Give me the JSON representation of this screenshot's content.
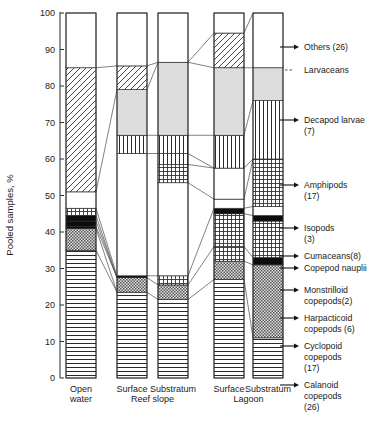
{
  "axis": {
    "y_title": "Pooled samples,  %",
    "y_ticks": [
      "100",
      "90",
      "80",
      "70",
      "60",
      "50",
      "40",
      "30",
      "20",
      "10",
      "0"
    ],
    "y_min": 0,
    "y_max": 100
  },
  "categories": [
    {
      "label_top": "Open",
      "label_bottom": "water",
      "group": ""
    },
    {
      "label_top": "Surface",
      "label_bottom": "",
      "group": "Reef slope"
    },
    {
      "label_top": "Substratum",
      "label_bottom": "",
      "group": "Reef slope"
    },
    {
      "label_top": "Surface",
      "label_bottom": "",
      "group": "Lagoon"
    },
    {
      "label_top": "Substratum",
      "label_bottom": "",
      "group": "Lagoon"
    }
  ],
  "group_labels": [
    {
      "text": "Reef slope"
    },
    {
      "text": "Lagoon"
    }
  ],
  "legend": [
    {
      "key": "others",
      "lines": [
        "Others (26)"
      ],
      "marker": "arrow"
    },
    {
      "key": "larvaceans",
      "lines": [
        "Larvaceans"
      ],
      "marker": "dashed"
    },
    {
      "key": "decapod",
      "lines": [
        "Decapod larvae",
        "(7)"
      ],
      "marker": "arrow"
    },
    {
      "key": "amphipods",
      "lines": [
        "Amphipods",
        "(17)"
      ],
      "marker": "arrow"
    },
    {
      "key": "isopods",
      "lines": [
        "Isopods",
        "(3)"
      ],
      "marker": "arrow"
    },
    {
      "key": "cumaceans",
      "lines": [
        "Cumaceans(8)"
      ],
      "marker": "arrow"
    },
    {
      "key": "nauplii",
      "lines": [
        "Copepod nauplii"
      ],
      "marker": "arrow"
    },
    {
      "key": "monstrilloid",
      "lines": [
        "Monstrilloid",
        "copepods(2)"
      ],
      "marker": "arrow"
    },
    {
      "key": "harpacticoid",
      "lines": [
        "Harpacticoid",
        "copepods (6)"
      ],
      "marker": "arrow"
    },
    {
      "key": "cyclopoid",
      "lines": [
        "Cyclopoid",
        "copepods",
        "(17)"
      ],
      "marker": "arrow"
    },
    {
      "key": "calanoid",
      "lines": [
        "Calanoid",
        "copepods",
        "(26)"
      ],
      "marker": "arrow"
    }
  ],
  "chart_data": {
    "type": "bar",
    "title": "",
    "xlabel": "",
    "ylabel": "Pooled samples,  %",
    "ylim": [
      0,
      100
    ],
    "grid": false,
    "legend_position": "right",
    "stacked": true,
    "categories": [
      "Open water",
      "Surface Reef slope",
      "Substratum Reef slope",
      "Surface Lagoon",
      "Substratum Lagoon"
    ],
    "series": [
      {
        "name": "Calanoid copepods (26)",
        "values": [
          35.0,
          23.5,
          21.5,
          27.0,
          11.0
        ]
      },
      {
        "name": "Cyclopoid copepods (17)",
        "values": [
          6.0,
          4.0,
          4.0,
          5.0,
          20.0
        ]
      },
      {
        "name": "Harpacticoid copepods (6)",
        "values": [
          0.5,
          0.5,
          2.5,
          4.0,
          2.0
        ]
      },
      {
        "name": "Monstrilloid copepods (2)",
        "values": [
          1.5,
          0.0,
          0.0,
          9.0,
          10.0
        ]
      },
      {
        "name": "Copepod nauplii",
        "values": [
          1.5,
          0.0,
          0.0,
          1.5,
          1.5
        ]
      },
      {
        "name": "Cumaceans (8)",
        "values": [
          2.0,
          0.0,
          0.0,
          2.5,
          2.5
        ]
      },
      {
        "name": "Isopods (3)",
        "values": [
          4.5,
          0.0,
          0.0,
          0.0,
          13.0
        ]
      },
      {
        "name": "Amphipods (17)",
        "values": [
          0.0,
          30.5,
          23.5,
          8.5,
          16.0
        ]
      },
      {
        "name": "Decapod larvae (7)",
        "values": [
          0.0,
          12.5,
          20.0,
          27.0,
          9.0
        ]
      },
      {
        "name": "Larvaceans",
        "values": [
          34.0,
          6.0,
          0.5,
          9.5,
          0.0
        ]
      },
      {
        "name": "Others (26)",
        "values": [
          15.0,
          23.0,
          28.0,
          6.0,
          15.0
        ]
      }
    ]
  },
  "bars": [
    {
      "name": "open-water",
      "x": 66,
      "w": 30,
      "segments": [
        {
          "key": "calanoid",
          "from": 0.0,
          "to": 35.0,
          "fill": "hlines"
        },
        {
          "key": "cyclopoid",
          "from": 35.0,
          "to": 41.0,
          "fill": "checkdark"
        },
        {
          "key": "harpacticoid",
          "from": 41.0,
          "to": 41.5,
          "fill": "solid"
        },
        {
          "key": "monstrilloid",
          "from": 41.5,
          "to": 43.0,
          "fill": "solid"
        },
        {
          "key": "nauplii",
          "from": 43.0,
          "to": 44.5,
          "fill": "solid"
        },
        {
          "key": "cumaceans",
          "from": 44.5,
          "to": 46.5,
          "fill": "grid"
        },
        {
          "key": "isopods",
          "from": 46.5,
          "to": 51.0,
          "fill": "white"
        },
        {
          "key": "larvaceans",
          "from": 51.0,
          "to": 85.0,
          "fill": "diag"
        },
        {
          "key": "others",
          "from": 85.0,
          "to": 100.0,
          "fill": "white"
        }
      ]
    },
    {
      "name": "surface-reef-slope",
      "x": 117,
      "w": 30,
      "segments": [
        {
          "key": "calanoid",
          "from": 0.0,
          "to": 23.5,
          "fill": "hlines"
        },
        {
          "key": "cyclopoid",
          "from": 23.5,
          "to": 27.5,
          "fill": "checkdark"
        },
        {
          "key": "harpacticoid",
          "from": 27.5,
          "to": 28.0,
          "fill": "solid"
        },
        {
          "key": "amphipods",
          "from": 28.0,
          "to": 61.5,
          "fill": "white"
        },
        {
          "key": "decapod",
          "from": 61.5,
          "to": 66.5,
          "fill": "vlines"
        },
        {
          "key": "decapod2",
          "from": 66.5,
          "to": 79.0,
          "fill": "grey"
        },
        {
          "key": "larvaceans",
          "from": 79.0,
          "to": 85.5,
          "fill": "diag"
        },
        {
          "key": "others",
          "from": 85.5,
          "to": 100.0,
          "fill": "white"
        }
      ]
    },
    {
      "name": "substratum-reef-slope",
      "x": 158,
      "w": 30,
      "segments": [
        {
          "key": "calanoid",
          "from": 0.0,
          "to": 21.5,
          "fill": "hlines"
        },
        {
          "key": "cyclopoid",
          "from": 21.5,
          "to": 25.5,
          "fill": "checkdark"
        },
        {
          "key": "harpacticoid",
          "from": 25.5,
          "to": 28.0,
          "fill": "grid"
        },
        {
          "key": "amphipods",
          "from": 28.0,
          "to": 53.5,
          "fill": "white"
        },
        {
          "key": "isopods",
          "from": 53.5,
          "to": 58.5,
          "fill": "grid"
        },
        {
          "key": "cumaceans",
          "from": 58.5,
          "to": 61.5,
          "fill": "vlines"
        },
        {
          "key": "decapod",
          "from": 61.5,
          "to": 66.5,
          "fill": "vlines"
        },
        {
          "key": "decapod2",
          "from": 66.5,
          "to": 86.5,
          "fill": "grey"
        },
        {
          "key": "others",
          "from": 86.5,
          "to": 100.0,
          "fill": "white"
        }
      ]
    },
    {
      "name": "surface-lagoon",
      "x": 214,
      "w": 30,
      "segments": [
        {
          "key": "calanoid",
          "from": 0.0,
          "to": 27.0,
          "fill": "hlines"
        },
        {
          "key": "cyclopoid",
          "from": 27.0,
          "to": 32.0,
          "fill": "checkdark"
        },
        {
          "key": "harpacticoid",
          "from": 32.0,
          "to": 36.0,
          "fill": "grid"
        },
        {
          "key": "monstrilloid",
          "from": 36.0,
          "to": 45.0,
          "fill": "grid"
        },
        {
          "key": "nauplii",
          "from": 45.0,
          "to": 46.5,
          "fill": "solid"
        },
        {
          "key": "cumaceans",
          "from": 46.5,
          "to": 49.0,
          "fill": "white"
        },
        {
          "key": "amphipods",
          "from": 49.0,
          "to": 57.5,
          "fill": "white"
        },
        {
          "key": "decapod",
          "from": 57.5,
          "to": 66.5,
          "fill": "vlines"
        },
        {
          "key": "decapod2",
          "from": 66.5,
          "to": 85.0,
          "fill": "grey"
        },
        {
          "key": "larvaceans",
          "from": 85.0,
          "to": 94.5,
          "fill": "diag"
        },
        {
          "key": "others",
          "from": 94.5,
          "to": 100.0,
          "fill": "white"
        }
      ]
    },
    {
      "name": "substratum-lagoon",
      "x": 253,
      "w": 30,
      "segments": [
        {
          "key": "calanoid",
          "from": 0.0,
          "to": 11.0,
          "fill": "hlines"
        },
        {
          "key": "cyclopoid",
          "from": 11.0,
          "to": 31.0,
          "fill": "checkdark"
        },
        {
          "key": "harpacticoid",
          "from": 31.0,
          "to": 33.0,
          "fill": "solid"
        },
        {
          "key": "monstrilloid",
          "from": 33.0,
          "to": 43.0,
          "fill": "grid"
        },
        {
          "key": "nauplii",
          "from": 43.0,
          "to": 44.5,
          "fill": "solid"
        },
        {
          "key": "cumaceans",
          "from": 44.5,
          "to": 47.0,
          "fill": "white"
        },
        {
          "key": "isopods",
          "from": 47.0,
          "to": 60.0,
          "fill": "grid"
        },
        {
          "key": "amphipods",
          "from": 60.0,
          "to": 76.0,
          "fill": "vlines"
        },
        {
          "key": "decapod2",
          "from": 76.0,
          "to": 85.0,
          "fill": "grey"
        },
        {
          "key": "others",
          "from": 85.0,
          "to": 100.0,
          "fill": "white"
        }
      ]
    }
  ],
  "connectors": [
    {
      "from_bar": 0,
      "from_v": 85.0,
      "to_bar": 1,
      "to_v": 85.5
    },
    {
      "from_bar": 1,
      "from_v": 85.5,
      "to_bar": 2,
      "to_v": 86.5
    },
    {
      "from_bar": 2,
      "from_v": 86.5,
      "to_bar": 3,
      "to_v": 94.5
    },
    {
      "from_bar": 3,
      "from_v": 94.5,
      "to_bar": 4,
      "to_v": 100.0
    },
    {
      "from_bar": 0,
      "from_v": 51.0,
      "to_bar": 1,
      "to_v": 79.0
    },
    {
      "from_bar": 1,
      "from_v": 79.0,
      "to_bar": 2,
      "to_v": 86.5
    },
    {
      "from_bar": 2,
      "from_v": 86.5,
      "to_bar": 3,
      "to_v": 85.0
    },
    {
      "from_bar": 3,
      "from_v": 85.0,
      "to_bar": 4,
      "to_v": 85.0
    },
    {
      "from_bar": 1,
      "from_v": 66.5,
      "to_bar": 2,
      "to_v": 66.5
    },
    {
      "from_bar": 2,
      "from_v": 66.5,
      "to_bar": 3,
      "to_v": 66.5
    },
    {
      "from_bar": 3,
      "from_v": 66.5,
      "to_bar": 4,
      "to_v": 76.0
    },
    {
      "from_bar": 1,
      "from_v": 61.5,
      "to_bar": 2,
      "to_v": 61.5
    },
    {
      "from_bar": 2,
      "from_v": 58.5,
      "to_bar": 3,
      "to_v": 57.5
    },
    {
      "from_bar": 3,
      "from_v": 57.5,
      "to_bar": 4,
      "to_v": 60.0
    },
    {
      "from_bar": 0,
      "from_v": 46.5,
      "to_bar": 1,
      "to_v": 28.0
    },
    {
      "from_bar": 0,
      "from_v": 44.5,
      "to_bar": 1,
      "to_v": 27.5
    },
    {
      "from_bar": 0,
      "from_v": 43.0,
      "to_bar": 1,
      "to_v": 27.5
    },
    {
      "from_bar": 0,
      "from_v": 41.5,
      "to_bar": 1,
      "to_v": 27.5
    },
    {
      "from_bar": 0,
      "from_v": 41.0,
      "to_bar": 1,
      "to_v": 23.5
    },
    {
      "from_bar": 0,
      "from_v": 35.0,
      "to_bar": 1,
      "to_v": 23.5
    },
    {
      "from_bar": 1,
      "from_v": 28.0,
      "to_bar": 2,
      "to_v": 28.0
    },
    {
      "from_bar": 1,
      "from_v": 27.5,
      "to_bar": 2,
      "to_v": 25.5
    },
    {
      "from_bar": 1,
      "from_v": 23.5,
      "to_bar": 2,
      "to_v": 21.5
    },
    {
      "from_bar": 2,
      "from_v": 28.0,
      "to_bar": 3,
      "to_v": 46.5
    },
    {
      "from_bar": 2,
      "from_v": 25.5,
      "to_bar": 3,
      "to_v": 36.0
    },
    {
      "from_bar": 2,
      "from_v": 21.5,
      "to_bar": 3,
      "to_v": 27.0
    },
    {
      "from_bar": 3,
      "from_v": 49.0,
      "to_bar": 4,
      "to_v": 60.0
    },
    {
      "from_bar": 3,
      "from_v": 46.5,
      "to_bar": 4,
      "to_v": 47.0
    },
    {
      "from_bar": 3,
      "from_v": 45.0,
      "to_bar": 4,
      "to_v": 44.5
    },
    {
      "from_bar": 3,
      "from_v": 36.0,
      "to_bar": 4,
      "to_v": 33.0
    },
    {
      "from_bar": 3,
      "from_v": 32.0,
      "to_bar": 4,
      "to_v": 31.0
    },
    {
      "from_bar": 3,
      "from_v": 27.0,
      "to_bar": 4,
      "to_v": 11.0
    },
    {
      "from_bar": 2,
      "from_v": 53.5,
      "to_bar": 3,
      "to_v": 49.0
    },
    {
      "from_bar": 2,
      "from_v": 61.5,
      "to_bar": 3,
      "to_v": 57.5
    }
  ],
  "leaders": [
    {
      "key": "others",
      "y": 47,
      "bar": 4,
      "bar_y": 65
    },
    {
      "key": "larvaceans",
      "y": 70,
      "bar": 4,
      "bar_y": 70
    },
    {
      "key": "decapod",
      "y": 120,
      "bar": 4,
      "bar_y": 120
    },
    {
      "key": "amphipods",
      "y": 185,
      "bar": 4,
      "bar_y": 185
    },
    {
      "key": "isopods",
      "y": 228,
      "bar": 4,
      "bar_y": 228
    },
    {
      "key": "cumaceans",
      "y": 256,
      "bar": 4,
      "bar_y": 256
    },
    {
      "key": "nauplii",
      "y": 268,
      "bar": 4,
      "bar_y": 268
    },
    {
      "key": "monstrilloid",
      "y": 290,
      "bar": 4,
      "bar_y": 290
    },
    {
      "key": "harpacticoid",
      "y": 318,
      "bar": 4,
      "bar_y": 318
    },
    {
      "key": "cyclopoid",
      "y": 346,
      "bar": 4,
      "bar_y": 346
    },
    {
      "key": "calanoid",
      "y": 385,
      "bar": 4,
      "bar_y": 385
    }
  ]
}
